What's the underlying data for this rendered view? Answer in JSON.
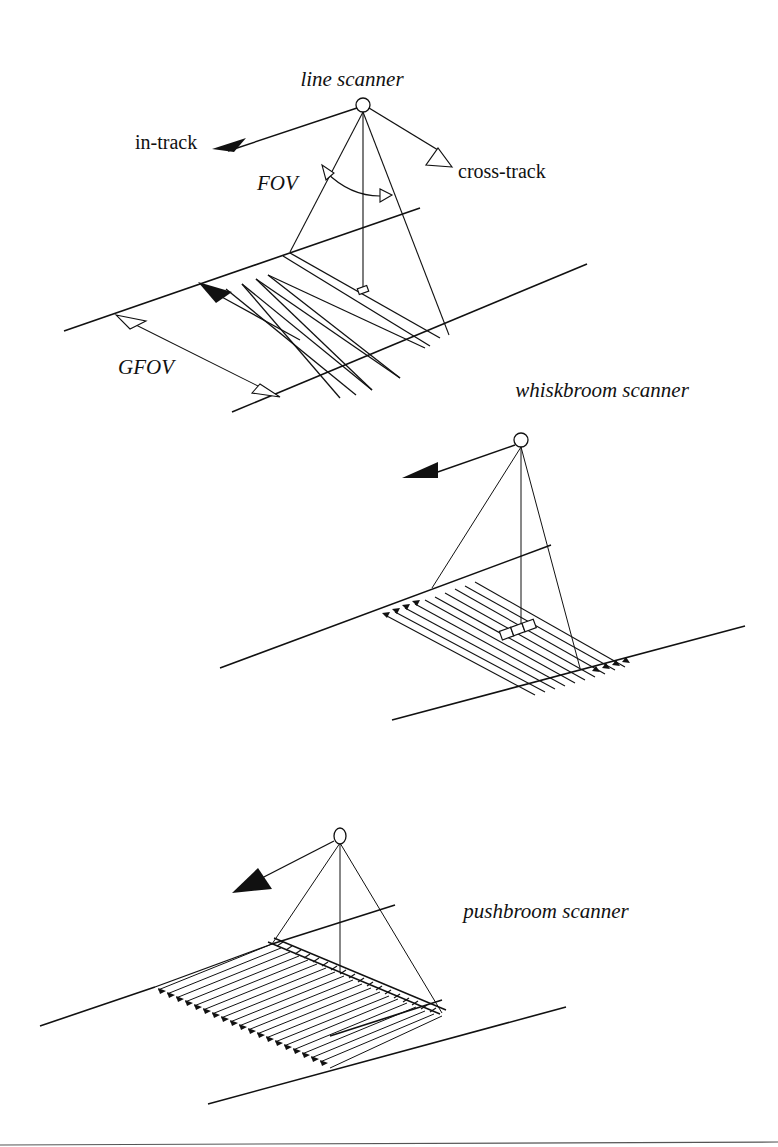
{
  "figure": {
    "panels": [
      {
        "id": "line",
        "title": "line scanner",
        "labels": {
          "in_track": "in-track",
          "cross_track": "cross-track",
          "fov": "FOV",
          "gfov": "GFOV"
        }
      },
      {
        "id": "whiskbroom",
        "title": "whiskbroom scanner"
      },
      {
        "id": "pushbroom",
        "title": "pushbroom scanner"
      }
    ],
    "colors": {
      "ink": "#111111",
      "background": "#ffffff",
      "rule": "#555555"
    }
  }
}
